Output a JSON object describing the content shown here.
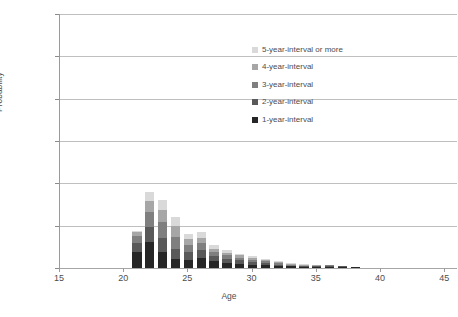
{
  "chart_data": {
    "type": "bar",
    "stacked": true,
    "title": "",
    "subtitle": "",
    "xlabel": "Age",
    "ylabel": "Probability",
    "xlim": [
      15,
      46
    ],
    "ylim": [
      0.0,
      0.3
    ],
    "xticks": [
      15,
      20,
      25,
      30,
      35,
      40,
      45
    ],
    "yticks": [
      0.0,
      0.05,
      0.1,
      0.15,
      0.2,
      0.25,
      0.3
    ],
    "xtick_labels": [
      "15",
      "20",
      "25",
      "30",
      "35",
      "40",
      "45"
    ],
    "ytick_labels": [
      "0.00",
      "0.05",
      "0.10",
      "0.15",
      "0.20",
      "0.25",
      "0.30"
    ],
    "grid": "horizontal",
    "legend_position": "inside-upper-center-right",
    "categories": [
      21,
      22,
      23,
      24,
      25,
      26,
      27,
      28,
      29,
      30,
      31,
      32,
      33,
      34,
      35,
      36,
      37,
      38,
      39,
      40,
      41,
      42,
      43,
      44
    ],
    "series": [
      {
        "name": "1-year-interval",
        "color": "#262626",
        "values": [
          0.019,
          0.031,
          0.019,
          0.011,
          0.01,
          0.012,
          0.008,
          0.006,
          0.005,
          0.004,
          0.003,
          0.002,
          0.002,
          0.001,
          0.001,
          0.001,
          0.001,
          0.001,
          0.0,
          0.0,
          0.0,
          0.0,
          0.0,
          0.0
        ]
      },
      {
        "name": "2-year-interval",
        "color": "#595959",
        "values": [
          0.011,
          0.018,
          0.017,
          0.012,
          0.009,
          0.009,
          0.006,
          0.005,
          0.004,
          0.003,
          0.003,
          0.002,
          0.001,
          0.001,
          0.001,
          0.001,
          0.001,
          0.0,
          0.0,
          0.0,
          0.0,
          0.0,
          0.0,
          0.0
        ]
      },
      {
        "name": "3-year-interval",
        "color": "#7f7f7f",
        "values": [
          0.008,
          0.017,
          0.018,
          0.014,
          0.008,
          0.008,
          0.005,
          0.004,
          0.003,
          0.003,
          0.002,
          0.002,
          0.001,
          0.001,
          0.001,
          0.001,
          0.0,
          0.0,
          0.0,
          0.0,
          0.0,
          0.0,
          0.0,
          0.0
        ]
      },
      {
        "name": "4-year-interval",
        "color": "#a6a6a6",
        "values": [
          0.004,
          0.013,
          0.015,
          0.013,
          0.007,
          0.007,
          0.004,
          0.003,
          0.003,
          0.002,
          0.002,
          0.001,
          0.001,
          0.001,
          0.001,
          0.0,
          0.0,
          0.0,
          0.0,
          0.0,
          0.0,
          0.0,
          0.0,
          0.0
        ]
      },
      {
        "name": "5-year-interval or more",
        "color": "#d9d9d9",
        "values": [
          0.002,
          0.011,
          0.011,
          0.01,
          0.006,
          0.006,
          0.004,
          0.003,
          0.002,
          0.002,
          0.001,
          0.001,
          0.001,
          0.001,
          0.0,
          0.0,
          0.0,
          0.0,
          0.0,
          0.0,
          0.0,
          0.0,
          0.0,
          0.0
        ]
      }
    ],
    "totals": [
      0.044,
      0.09,
      0.08,
      0.06,
      0.04,
      0.042,
      0.027,
      0.021,
      0.017,
      0.014,
      0.011,
      0.008,
      0.006,
      0.005,
      0.004,
      0.003,
      0.002,
      0.001,
      0.0,
      0.0,
      0.0,
      0.0,
      0.0,
      0.0
    ]
  },
  "legend": {
    "items": [
      {
        "label": "5-year-interval or more",
        "color": "#d9d9d9"
      },
      {
        "label": "4-year-interval",
        "color": "#a6a6a6"
      },
      {
        "label": "3-year-interval",
        "color": "#7f7f7f"
      },
      {
        "label": "2-year-interval",
        "color": "#595959"
      },
      {
        "label": "1-year-interval",
        "color": "#262626"
      }
    ]
  },
  "axes": {
    "y_title": "Probability",
    "x_title": "Age"
  },
  "colors": {
    "gridline": "#bfbfbf",
    "axis": "#9a9a9a",
    "text": "#4d4d4d",
    "background": "#ffffff"
  }
}
